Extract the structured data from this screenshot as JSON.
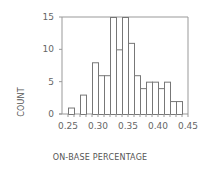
{
  "chart_data": {
    "type": "bar",
    "title": "",
    "xlabel": "ON-BASE PERCENTAGE",
    "ylabel": "COUNT",
    "bin_width": 0.01,
    "bin_start": 0.25,
    "categories": [
      "0.25",
      "0.26",
      "0.27",
      "0.28",
      "0.29",
      "0.30",
      "0.31",
      "0.32",
      "0.33",
      "0.34",
      "0.35",
      "0.36",
      "0.37",
      "0.38",
      "0.39",
      "0.40",
      "0.41",
      "0.42",
      "0.43"
    ],
    "values": [
      1,
      0,
      3,
      0,
      8,
      6,
      6,
      15,
      10,
      15,
      11,
      6,
      4,
      5,
      5,
      4,
      5,
      2,
      2
    ],
    "xlim": [
      0.24,
      0.45
    ],
    "ylim": [
      0,
      15
    ],
    "xticks": [
      "0.25",
      "0.30",
      "0.35",
      "0.40",
      "0.45"
    ],
    "xtick_values": [
      0.25,
      0.3,
      0.35,
      0.4,
      0.45
    ],
    "yticks": [
      "0",
      "5",
      "10",
      "15"
    ],
    "ytick_values": [
      0,
      5,
      10,
      15
    ],
    "grid": false,
    "legend": null,
    "colors": {
      "bar_fill": "#ffffff",
      "bar_stroke": "#777777",
      "axis": "#999999",
      "text": "#666666"
    }
  }
}
